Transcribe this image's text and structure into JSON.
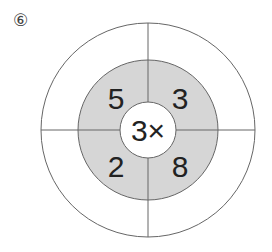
{
  "problem": {
    "label": "⑥",
    "center_operator": "3×",
    "segments": [
      {
        "position": "top-left",
        "value": "5"
      },
      {
        "position": "top-right",
        "value": "3"
      },
      {
        "position": "bottom-left",
        "value": "2"
      },
      {
        "position": "bottom-right",
        "value": "8"
      }
    ],
    "outer_answers": [
      "",
      "",
      "",
      ""
    ]
  },
  "colors": {
    "ring_fill": "#d6d6d6",
    "line": "#666666",
    "text": "#222222"
  }
}
